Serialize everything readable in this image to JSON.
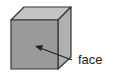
{
  "diagram": {
    "type": "cube-illustration",
    "labels": {
      "face": "face"
    },
    "colors": {
      "front_face": "#9a9a9a",
      "top_face": "#c4c4c4",
      "side_face": "#b0b0b0",
      "edge": "#333333",
      "arrow": "#222222",
      "text": "#222222"
    }
  }
}
